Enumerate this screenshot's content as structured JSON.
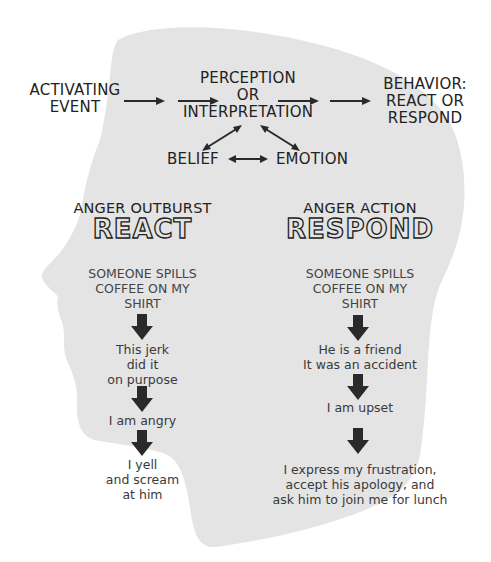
{
  "flow": {
    "activating_event": [
      "ACTIVATING",
      "EVENT"
    ],
    "perception": [
      "PERCEPTION",
      "OR",
      "INTERPRETATION"
    ],
    "behavior": [
      "BEHAVIOR:",
      "REACT OR",
      "RESPOND"
    ],
    "belief": "BELIEF",
    "emotion": "EMOTION"
  },
  "left_column": {
    "heading": "ANGER OUTBURST",
    "title": "REACT",
    "steps": [
      [
        "SOMEONE SPILLS",
        "COFFEE ON MY",
        "SHIRT"
      ],
      [
        "This jerk",
        "did it",
        "on purpose"
      ],
      [
        "I am angry"
      ],
      [
        "I yell",
        "and scream",
        "at him"
      ]
    ]
  },
  "right_column": {
    "heading": "ANGER ACTION",
    "title": "RESPOND",
    "steps": [
      [
        "SOMEONE SPILLS",
        "COFFEE ON MY",
        "SHIRT"
      ],
      [
        "He is a friend",
        "It was an accident"
      ],
      [
        "I am upset"
      ],
      [
        "I express my frustration,",
        "accept his apology, and",
        "ask him to join me for lunch"
      ]
    ]
  },
  "colors": {
    "head_fill": "#e4e4e4",
    "text": "#222222",
    "arrow": "#2a2a2a",
    "background": "#ffffff"
  },
  "icons": {
    "flow_arrow": "right-arrow-icon",
    "bidirectional_arrow": "double-arrow-icon",
    "step_arrow": "down-arrow-icon",
    "background_shape": "head-silhouette"
  }
}
